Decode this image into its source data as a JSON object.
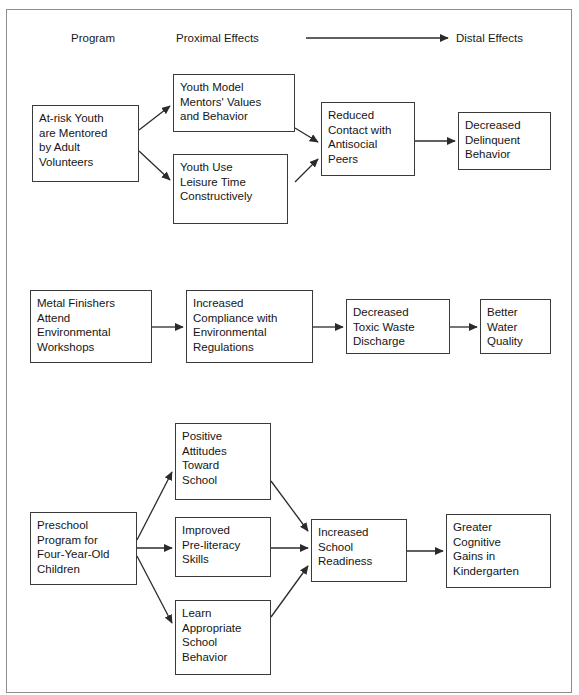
{
  "figure": {
    "kind": "logic-model-flow-diagram",
    "frame_color": "#8d8d8d",
    "box_border_color": "#3a3a3a",
    "arrow_color": "#2b2b2b",
    "background": "#ffffff"
  },
  "header": {
    "program_label": "Program",
    "proximal_label": "Proximal Effects",
    "distal_label": "Distal Effects",
    "arrow_icon": "long-right-arrow-icon"
  },
  "models": [
    {
      "id": "mentoring",
      "nodes": [
        {
          "id": "m-program",
          "text": "At-risk Youth\nare Mentored\nby Adult\nVolunteers"
        },
        {
          "id": "m-prox-1",
          "text": "Youth Model\nMentors' Values\nand Behavior"
        },
        {
          "id": "m-prox-2",
          "text": "Youth Use\nLeisure Time\nConstructively"
        },
        {
          "id": "m-mid",
          "text": "Reduced\nContact with\nAntisocial\nPeers"
        },
        {
          "id": "m-distal",
          "text": "Decreased\nDelinquent\nBehavior"
        }
      ],
      "edges": [
        {
          "from": "m-program",
          "to": "m-prox-1"
        },
        {
          "from": "m-program",
          "to": "m-prox-2"
        },
        {
          "from": "m-prox-1",
          "to": "m-mid"
        },
        {
          "from": "m-prox-2",
          "to": "m-mid"
        },
        {
          "from": "m-mid",
          "to": "m-distal"
        }
      ]
    },
    {
      "id": "metal-finishers",
      "nodes": [
        {
          "id": "e-program",
          "text": "Metal Finishers\nAttend\nEnvironmental\nWorkshops"
        },
        {
          "id": "e-prox",
          "text": "Increased\nCompliance with\nEnvironmental\nRegulations"
        },
        {
          "id": "e-mid",
          "text": "Decreased\nToxic Waste\nDischarge"
        },
        {
          "id": "e-distal",
          "text": "Better\nWater\nQuality"
        }
      ],
      "edges": [
        {
          "from": "e-program",
          "to": "e-prox"
        },
        {
          "from": "e-prox",
          "to": "e-mid"
        },
        {
          "from": "e-mid",
          "to": "e-distal"
        }
      ]
    },
    {
      "id": "preschool",
      "nodes": [
        {
          "id": "p-program",
          "text": "Preschool\nProgram for\nFour-Year-Old\nChildren"
        },
        {
          "id": "p-prox-1",
          "text": "Positive\nAttitudes\nToward\nSchool"
        },
        {
          "id": "p-prox-2",
          "text": "Improved\nPre-literacy\nSkills"
        },
        {
          "id": "p-prox-3",
          "text": "Learn\nAppropriate\nSchool\nBehavior"
        },
        {
          "id": "p-mid",
          "text": "Increased\nSchool\nReadiness"
        },
        {
          "id": "p-distal",
          "text": "Greater\nCognitive\nGains in\nKindergarten"
        }
      ],
      "edges": [
        {
          "from": "p-program",
          "to": "p-prox-1"
        },
        {
          "from": "p-program",
          "to": "p-prox-2"
        },
        {
          "from": "p-program",
          "to": "p-prox-3"
        },
        {
          "from": "p-prox-1",
          "to": "p-mid"
        },
        {
          "from": "p-prox-2",
          "to": "p-mid"
        },
        {
          "from": "p-prox-3",
          "to": "p-mid"
        },
        {
          "from": "p-mid",
          "to": "p-distal"
        }
      ]
    }
  ]
}
